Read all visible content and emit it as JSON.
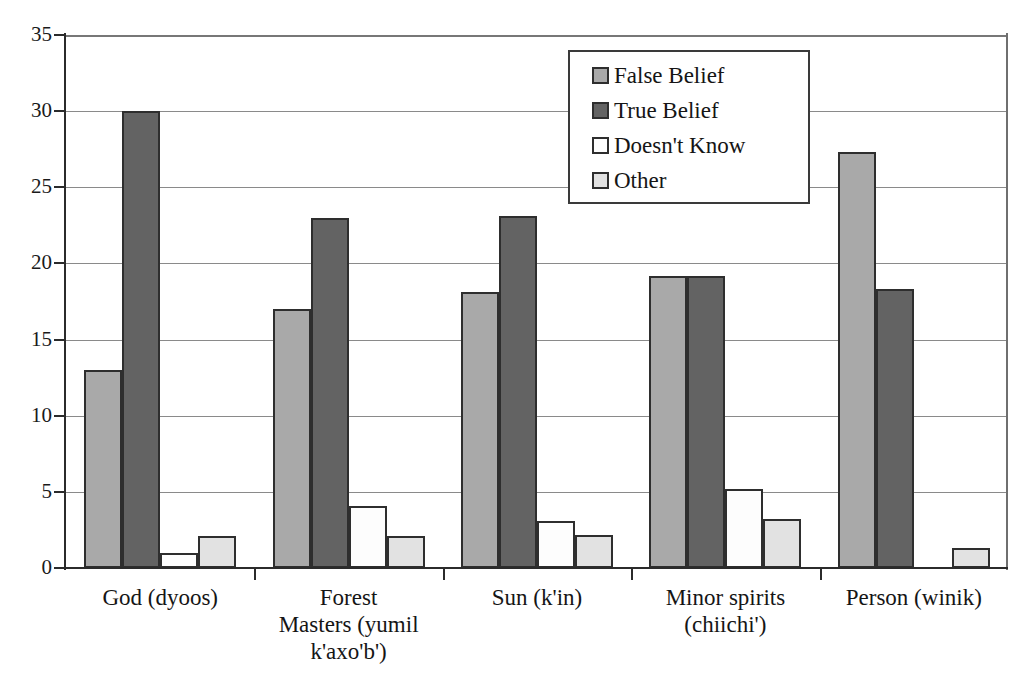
{
  "chart_data": {
    "type": "bar",
    "title": "",
    "subtitle": "",
    "xlabel": "",
    "ylabel": "",
    "ylim": [
      0,
      35
    ],
    "yticks": [
      0,
      5,
      10,
      15,
      20,
      25,
      30,
      35
    ],
    "ytick_labels": [
      "0",
      "5",
      "10",
      "15",
      "20",
      "25",
      "30",
      "35"
    ],
    "grid": true,
    "grid_axis": "y",
    "legend_position": "top-right",
    "categories": [
      "God (dyoos)",
      "Forest Masters (yumil k'axo'b')",
      "Sun (k'in)",
      "Minor spirits (chiichi')",
      "Person (winik)"
    ],
    "category_lines": [
      [
        "God (dyoos)"
      ],
      [
        "Forest",
        "Masters (yumil",
        "k'axo'b')"
      ],
      [
        "Sun (k'in)"
      ],
      [
        "Minor spirits",
        "(chiichi')"
      ],
      [
        "Person (winik)"
      ]
    ],
    "series": [
      {
        "name": "False Belief",
        "color": "#a9a9a9",
        "values": [
          13.0,
          17.0,
          18.1,
          19.2,
          27.3
        ]
      },
      {
        "name": "True Belief",
        "color": "#636363",
        "values": [
          30.0,
          23.0,
          23.1,
          19.2,
          18.3
        ]
      },
      {
        "name": "Doesn't Know",
        "color": "#fdfdfd",
        "values": [
          1.0,
          4.1,
          3.1,
          5.2,
          0.0
        ]
      },
      {
        "name": "Other",
        "color": "#e2e2e2",
        "values": [
          2.1,
          2.1,
          2.2,
          3.2,
          1.3
        ]
      }
    ]
  },
  "legend": {
    "items": [
      {
        "label": "False Belief",
        "color": "#a9a9a9"
      },
      {
        "label": "True Belief",
        "color": "#636363"
      },
      {
        "label": "Doesn't Know",
        "color": "#fdfdfd"
      },
      {
        "label": "Other",
        "color": "#e2e2e2"
      }
    ]
  }
}
